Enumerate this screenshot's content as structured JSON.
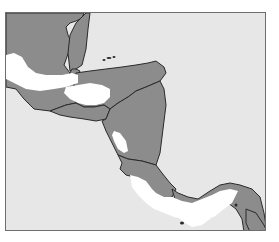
{
  "map": {
    "title": "Central America",
    "colors": {
      "sea": "#e7e7e7",
      "land": "#8c8c8c",
      "highlight": "#ffffff",
      "border": "#2a2a2a",
      "frame": "#6e6e6e"
    },
    "regions": [
      {
        "name": "mexico-yucatan-region",
        "kind": "land",
        "points": "0,0 78,0 76,5 70,8 64,10 60,14 62,22 66,30 58,52 64,60 60,66 50,68 46,72 30,62 14,50 0,44"
      },
      {
        "name": "belize-region",
        "kind": "land",
        "points": "64,22 70,10 76,4 80,0 84,0 82,16 80,36 76,52 70,56 64,58 62,40"
      },
      {
        "name": "guatemala-region",
        "kind": "land",
        "points": "0,44 14,50 30,62 46,72 50,68 60,66 64,60 66,56 70,56 74,58 68,72 70,90 60,92 44,98 28,96 18,86 10,76 0,74"
      },
      {
        "name": "honduras-region",
        "kind": "land",
        "points": "70,60 84,58 100,56 116,54 130,52 142,50 150,48 158,54 160,60 154,68 140,74 130,78 122,84 112,90 104,96 98,92 88,94 78,94 70,90 68,72"
      },
      {
        "name": "el-salvador-region",
        "kind": "land",
        "points": "44,98 60,92 70,90 78,94 88,94 98,92 104,96 100,106 90,108 78,106 64,104 54,102"
      },
      {
        "name": "nicaragua-region",
        "kind": "land",
        "points": "104,96 112,90 122,84 130,78 140,74 154,68 158,76 160,92 158,108 156,124 154,140 150,152 136,148 122,146 112,142 106,130 100,118 96,108 100,106"
      },
      {
        "name": "costa-rica-region",
        "kind": "land",
        "points": "112,142 122,146 136,148 150,152 156,160 164,170 170,176 166,184 158,186 150,182 144,176 136,168 128,164 120,162 114,156 116,150"
      },
      {
        "name": "panama-region",
        "kind": "land",
        "points": "166,176 172,180 182,184 192,186 204,178 214,172 224,170 234,172 246,176 254,184 258,200 261,219 238,219 236,206 230,196 222,190 214,188 206,192 198,198 188,202 178,196 170,190"
      },
      {
        "name": "south-america-edge",
        "kind": "land",
        "points": "240,196 250,200 258,212 261,219 244,219 240,210"
      }
    ],
    "highlights": [
      {
        "name": "guatemala-highland-area",
        "points": "0,42 8,40 16,44 22,54 30,60 40,62 56,62 66,60 72,62 72,70 60,74 48,76 34,78 20,76 8,70 0,66"
      },
      {
        "name": "honduras-interior-area",
        "points": "60,74 72,72 84,70 96,72 104,76 104,84 98,90 90,92 80,92 72,90 64,86 58,80"
      },
      {
        "name": "nicaragua-lake-area",
        "points": "108,118 114,120 120,128 122,138 118,140 112,136 108,128 106,122"
      },
      {
        "name": "costa-rica-highland-area",
        "points": "124,162 132,164 140,168 146,176 150,180 158,184 166,184 176,188 186,190 196,186 206,182 214,178 224,176 232,178 226,190 218,196 208,204 196,206 186,208 178,206 168,204 158,200 148,196 140,190 132,182 126,174"
      },
      {
        "name": "panama-interior-area",
        "points": "170,192 180,196 190,198 198,196 206,194 212,196 204,206 196,212 186,214 176,208 168,200"
      }
    ],
    "islands": [
      {
        "name": "bay-island-1",
        "cx": 98,
        "cy": 47,
        "rx": 1.5,
        "ry": 1
      },
      {
        "name": "bay-island-2",
        "cx": 103,
        "cy": 45,
        "rx": 2.5,
        "ry": 1
      },
      {
        "name": "bay-island-3",
        "cx": 108,
        "cy": 44,
        "rx": 1.5,
        "ry": 1
      },
      {
        "name": "pacific-island-1",
        "cx": 176,
        "cy": 210,
        "rx": 2,
        "ry": 1.5
      },
      {
        "name": "pacific-island-2",
        "cx": 230,
        "cy": 192,
        "rx": 1.5,
        "ry": 1.5
      }
    ]
  }
}
